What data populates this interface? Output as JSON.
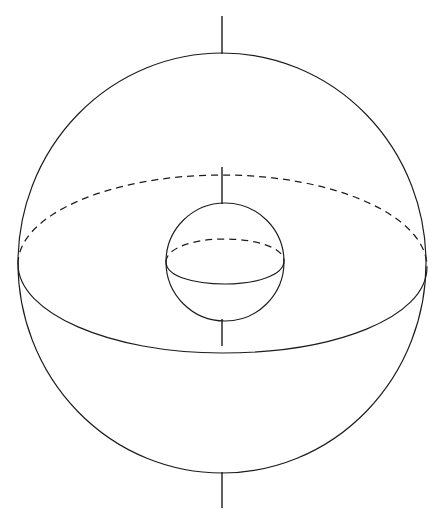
{
  "figure": {
    "background_color": "#ffffff",
    "line_color": "#1c1c1c",
    "canvas": {
      "width": 444,
      "height": 520
    }
  },
  "chart_data": {
    "type": "diagram",
    "xlabel": "",
    "ylabel": "",
    "grid": false,
    "legend": "none",
    "xlim": [
      0,
      444
    ],
    "ylim": [
      0,
      520
    ],
    "elements": [
      {
        "name": "outer-sphere-outline",
        "kind": "circle",
        "center": [
          222,
          263
        ],
        "radius": 205,
        "style": "solid"
      },
      {
        "name": "outer-equator-back-half",
        "kind": "ellipse-arc",
        "center": [
          222,
          263
        ],
        "semi_major_x": 204,
        "semi_minor_y": 89,
        "half": "upper-back",
        "style": "dashed"
      },
      {
        "name": "outer-equator-front-half",
        "kind": "ellipse-arc",
        "center": [
          222,
          263
        ],
        "semi_major_x": 204,
        "semi_minor_y": 90,
        "half": "lower-front",
        "style": "solid"
      },
      {
        "name": "inner-sphere-outline",
        "kind": "circle",
        "center": [
          225,
          262
        ],
        "radius": 59,
        "style": "solid"
      },
      {
        "name": "inner-equator-back-half",
        "kind": "ellipse-arc",
        "center": [
          225,
          262
        ],
        "semi_major_x": 59,
        "semi_minor_y": 23,
        "half": "upper-back",
        "style": "dashed"
      },
      {
        "name": "inner-equator-front-half",
        "kind": "ellipse-arc",
        "center": [
          225,
          262
        ],
        "semi_major_x": 59,
        "semi_minor_y": 22,
        "half": "lower-front",
        "style": "solid"
      },
      {
        "name": "polar-axis-top-external",
        "kind": "segment",
        "x": 222,
        "from_y": 16,
        "to_y": 54,
        "style": "solid"
      },
      {
        "name": "polar-axis-upper-internal",
        "kind": "segment",
        "x": 222,
        "from_y": 167,
        "to_y": 204,
        "style": "solid"
      },
      {
        "name": "polar-axis-lower-internal",
        "kind": "segment",
        "x": 222,
        "from_y": 319,
        "to_y": 346,
        "style": "solid"
      },
      {
        "name": "polar-axis-bottom-external",
        "kind": "segment",
        "x": 222,
        "from_y": 472,
        "to_y": 508,
        "style": "solid"
      }
    ],
    "annotations": [],
    "labels": [],
    "tick_labels": {
      "x": [],
      "y": []
    }
  },
  "geometry": {
    "outer_sphere": {
      "center_x": 222,
      "center_y": 263,
      "radius": 205,
      "left_x": 18,
      "right_x": 427,
      "top_y": 53,
      "bottom_y": 473,
      "path_circle": "M 18 263 A 204 210 0 1 1 426 263 A 204 210 0 1 1 18 263 Z"
    },
    "outer_equator": {
      "left_x": 18,
      "right_x": 427,
      "center_y": 264,
      "dashed_apex_y": 175,
      "solid_apex_y": 353,
      "path_back": "M 18 264 C 18 215 110 175 222 175 C 334 175 427 216 427 267",
      "path_front": "M 18 264 C 18 313 110 353 222 353 C 334 353 427 318 427 267"
    },
    "inner_sphere": {
      "center_x": 225,
      "center_y": 262,
      "radius": 59,
      "left_x": 166,
      "right_x": 285,
      "top_y": 203,
      "bottom_y": 320,
      "path_circle": "M 166 262 A 59 59 0 1 1 284 262 A 59 59 0 1 1 166 262 Z"
    },
    "inner_equator": {
      "left_x": 166,
      "right_x": 285,
      "center_y": 262,
      "dashed_apex_y": 239,
      "solid_apex_y": 284,
      "path_back": "M 166 262 C 166 248 193 239 225 239 C 257 239 284 248 284 261",
      "path_front": "M 166 262 C 166 276 193 284 225 284 C 257 284 284 275 284 261"
    },
    "polar_axis": {
      "x": 222,
      "segments": [
        {
          "from_y": 16,
          "to_y": 54
        },
        {
          "from_y": 167,
          "to_y": 204
        },
        {
          "from_y": 319,
          "to_y": 346
        },
        {
          "from_y": 472,
          "to_y": 508
        }
      ]
    }
  }
}
